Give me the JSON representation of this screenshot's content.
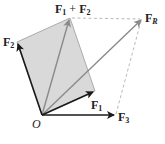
{
  "diagram": {
    "colors": {
      "parallelogram_fill": "#d9d9d9",
      "parallelogram_edge": "#9a9a9a",
      "component_arrows": "#1a1a1a",
      "sum_arrows": "#8a8a8a",
      "dashed_lines": "#b0b0b0",
      "labels": "#222222"
    },
    "points": {
      "O": [
        42,
        115
      ],
      "F1_tip": [
        93,
        92
      ],
      "F2_tip": [
        17,
        42
      ],
      "F1_plus_F2_tip": [
        70,
        18
      ],
      "F3_tip": [
        114,
        116
      ],
      "FR_tip": [
        142,
        19
      ]
    },
    "labels": {
      "origin": "O",
      "f1": {
        "main": "F",
        "sub": "1"
      },
      "f2": {
        "main": "F",
        "sub": "2"
      },
      "f3": {
        "main": "F",
        "sub": "3"
      },
      "fr": {
        "main": "F",
        "sub": "R"
      },
      "f1_plus_f2": {
        "main1": "F",
        "sub1": "1",
        "op": " + ",
        "main2": "F",
        "sub2": "2"
      }
    },
    "vectors": [
      {
        "name": "F1",
        "from": "O",
        "to": "F1_tip",
        "style": "solid-black"
      },
      {
        "name": "F2",
        "from": "O",
        "to": "F2_tip",
        "style": "solid-black"
      },
      {
        "name": "F3",
        "from": "O",
        "to": "F3_tip",
        "style": "solid-black"
      },
      {
        "name": "F1+F2",
        "from": "O",
        "to": "F1_plus_F2_tip",
        "style": "solid-gray"
      },
      {
        "name": "FR",
        "from": "O",
        "to": "FR_tip",
        "style": "solid-gray"
      }
    ],
    "dashed": [
      {
        "from": "F1_plus_F2_tip",
        "to": "FR_tip"
      },
      {
        "from": "F3_tip",
        "to": "FR_tip"
      }
    ]
  }
}
